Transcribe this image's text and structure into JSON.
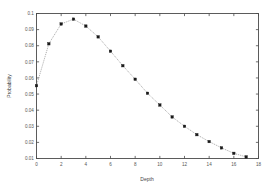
{
  "chart_data": {
    "type": "line",
    "title": "",
    "subtitle": "",
    "xlabel": "Depth",
    "ylabel": "Probability",
    "xlim": [
      0,
      18
    ],
    "ylim": [
      0.01,
      0.1
    ],
    "grid": false,
    "legend": null,
    "legend_position": "none",
    "marker": "square",
    "line_style": "dotted-thin",
    "xticks": [
      0,
      2,
      4,
      6,
      8,
      10,
      12,
      14,
      16,
      18
    ],
    "xtick_labels": [
      "0",
      "2",
      "4",
      "6",
      "8",
      "10",
      "12",
      "14",
      "16",
      "18"
    ],
    "yticks": [
      0.01,
      0.02,
      0.03,
      0.04,
      0.05,
      0.06,
      0.07,
      0.08,
      0.09,
      0.1
    ],
    "ytick_labels": [
      "0.01",
      "0.02",
      "0.03",
      "0.04",
      "0.05",
      "0.06",
      "0.07",
      "0.08",
      "0.09",
      "0.1"
    ],
    "x": [
      0,
      1,
      2,
      3,
      4,
      5,
      6,
      7,
      8,
      9,
      10,
      11,
      12,
      13,
      14,
      15,
      16,
      17
    ],
    "values": [
      0.0552,
      0.0812,
      0.0935,
      0.0965,
      0.0922,
      0.0855,
      0.0766,
      0.0676,
      0.0592,
      0.0505,
      0.0432,
      0.0358,
      0.03,
      0.0248,
      0.0205,
      0.0166,
      0.0132,
      0.011
    ],
    "series": [
      {
        "name": "Probability",
        "values": [
          0.0552,
          0.0812,
          0.0935,
          0.0965,
          0.0922,
          0.0855,
          0.0766,
          0.0676,
          0.0592,
          0.0505,
          0.0432,
          0.0358,
          0.03,
          0.0248,
          0.0205,
          0.0166,
          0.0132,
          0.011
        ]
      }
    ],
    "colors": {
      "line": "#9a9a9a",
      "marker": "#1a1a1a",
      "axis": "#4a4a4a",
      "background": "#ffffff",
      "text": "#555555"
    }
  }
}
